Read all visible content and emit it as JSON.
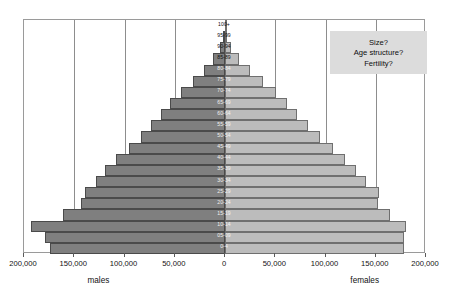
{
  "chart_data": {
    "type": "bar",
    "subtype": "population-pyramid",
    "title": "",
    "xlabel": "",
    "ylabel": "",
    "grid": true,
    "legend_position": "none",
    "orientation": "horizontal",
    "xlim": [
      -200000,
      200000
    ],
    "x_ticks": [
      -200000,
      -150000,
      -100000,
      -50000,
      0,
      50000,
      100000,
      150000,
      200000
    ],
    "x_tick_labels": [
      "200,000",
      "150,000",
      "100,000",
      "50,000",
      "0",
      "50,000",
      "100,000",
      "150,000",
      "200,000"
    ],
    "side_labels": {
      "left": "males",
      "right": "females"
    },
    "categories": [
      "0-4",
      "05-09",
      "10-14",
      "15-19",
      "20-24",
      "25-29",
      "30-34",
      "35-39",
      "40-44",
      "45-49",
      "50-54",
      "55-59",
      "60-64",
      "65-69",
      "70-74",
      "75-79",
      "80-84",
      "85-89",
      "90-94",
      "95-99",
      "100+"
    ],
    "series": [
      {
        "name": "males",
        "direction": "left",
        "color": "#7f7f7f",
        "values": [
          174000,
          179000,
          193000,
          161000,
          143000,
          139000,
          128000,
          119000,
          108000,
          96000,
          84000,
          74000,
          64000,
          55000,
          44000,
          32000,
          21000,
          12000,
          5000,
          1500,
          400
        ]
      },
      {
        "name": "females",
        "direction": "right",
        "color": "#bcbcbc",
        "values": [
          178000,
          178000,
          180000,
          164000,
          152000,
          153000,
          140000,
          130000,
          119000,
          107000,
          95000,
          83000,
          72000,
          62000,
          51000,
          38000,
          25000,
          14000,
          6000,
          1800,
          500
        ]
      }
    ]
  },
  "callout": {
    "lines": [
      "Size?",
      "Age structure?",
      "Fertility?"
    ]
  }
}
